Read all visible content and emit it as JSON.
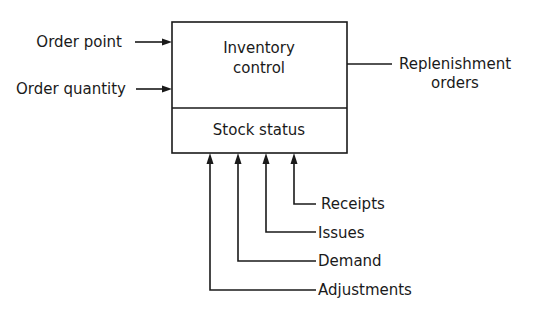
{
  "diagram": {
    "type": "block-diagram",
    "box": {
      "top_label_line1": "Inventory",
      "top_label_line2": "control",
      "bottom_label": "Stock status"
    },
    "inputs_left": [
      {
        "label": "Order point"
      },
      {
        "label": "Order quantity"
      }
    ],
    "output_right": {
      "label_line1": "Replenishment",
      "label_line2": "orders"
    },
    "inputs_bottom": [
      {
        "label": "Receipts"
      },
      {
        "label": "Issues"
      },
      {
        "label": "Demand"
      },
      {
        "label": "Adjustments"
      }
    ]
  }
}
